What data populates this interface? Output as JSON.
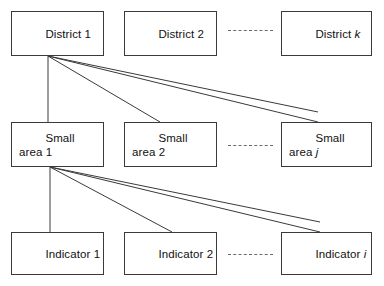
{
  "diagram": {
    "type": "hierarchy-tree",
    "title": "",
    "rows": [
      {
        "name": "district-row",
        "nodes": [
          {
            "label_main": "District ",
            "label_var": "1",
            "var_italic": false
          },
          {
            "label_main": "District ",
            "label_var": "2",
            "var_italic": false
          },
          {
            "label_main": "District ",
            "label_var": "k",
            "var_italic": true
          }
        ],
        "ellipsis": "--------"
      },
      {
        "name": "small-area-row",
        "nodes": [
          {
            "label_main": "Small\narea ",
            "label_var": "1",
            "var_italic": false
          },
          {
            "label_main": "Small\narea ",
            "label_var": "2",
            "var_italic": false
          },
          {
            "label_main": "Small\narea ",
            "label_var": "j",
            "var_italic": true
          }
        ],
        "ellipsis": "--------"
      },
      {
        "name": "indicator-row",
        "nodes": [
          {
            "label_main": "Indicator ",
            "label_var": "1",
            "var_italic": false
          },
          {
            "label_main": "Indicator ",
            "label_var": "2",
            "var_italic": false
          },
          {
            "label_main": "Indicator ",
            "label_var": "i",
            "var_italic": true
          }
        ],
        "ellipsis": "--------"
      }
    ],
    "colors": {
      "box_border": "#3a3a3a",
      "box_fill": "#ffffff",
      "connector": "#3a3a3a",
      "ellipsis": "#6b6b6b",
      "text": "#111111",
      "background": "#ffffff"
    }
  }
}
